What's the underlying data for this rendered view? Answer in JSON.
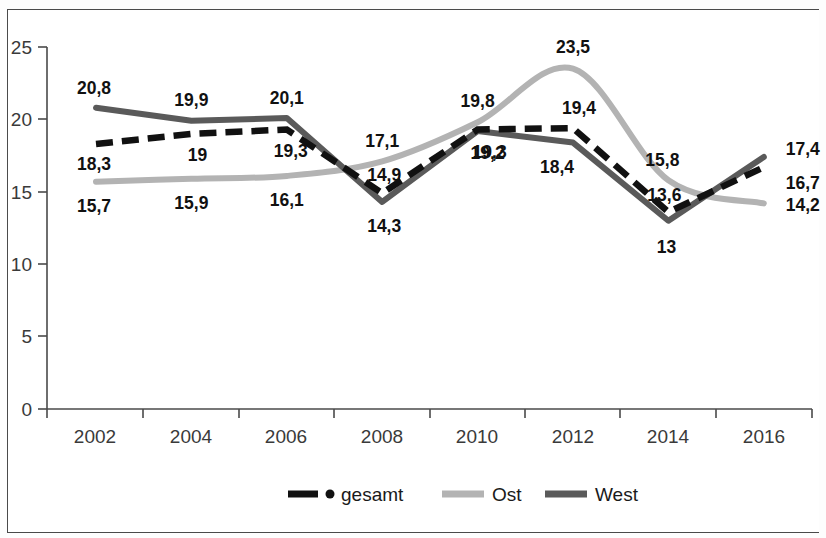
{
  "chart_data": {
    "type": "line",
    "title": "",
    "subtitle": "",
    "xlabel": "",
    "ylabel": "",
    "x": [
      2002,
      2004,
      2006,
      2008,
      2010,
      2012,
      2014,
      2016
    ],
    "categories": [
      "2002",
      "2004",
      "2006",
      "2008",
      "2010",
      "2012",
      "2014",
      "2016"
    ],
    "xtick_labels": [
      "2002",
      "2004",
      "2006",
      "2008",
      "2010",
      "2012",
      "2014",
      "2016"
    ],
    "ytick_labels": [
      "0",
      "5",
      "10",
      "15",
      "20",
      "25"
    ],
    "yticks": [
      0,
      5,
      10,
      15,
      20,
      25
    ],
    "ylim": [
      0,
      25
    ],
    "grid": false,
    "legend_position": "bottom",
    "series": [
      {
        "name": "gesamt",
        "color": "#111111",
        "style": "dashed",
        "values": [
          18.3,
          19,
          19.3,
          14.9,
          19.3,
          19.4,
          13.6,
          16.7
        ],
        "labels": [
          "18,3",
          "19",
          "19,3",
          "14,9",
          "19,3",
          "19,4",
          "13,6",
          "16,7"
        ]
      },
      {
        "name": "Ost",
        "color": "#b3b3b3",
        "style": "smooth",
        "values": [
          15.7,
          15.9,
          16.1,
          17.1,
          19.8,
          23.5,
          15.8,
          14.2
        ],
        "labels": [
          "15,7",
          "15,9",
          "16,1",
          "17,1",
          "19,8",
          "23,5",
          "15,8",
          "14,2"
        ]
      },
      {
        "name": "West",
        "color": "#5a5a5a",
        "style": "solid",
        "values": [
          20.8,
          19.9,
          20.1,
          14.3,
          19.2,
          18.4,
          13,
          17.4
        ],
        "labels": [
          "20,8",
          "19,9",
          "20,1",
          "14,3",
          "19,2",
          "18,4",
          "13",
          "17,4"
        ]
      }
    ]
  },
  "legend": {
    "items": [
      {
        "label": "gesamt",
        "color": "#111111",
        "marker": "dashed-line-with-dot"
      },
      {
        "label": "Ost",
        "color": "#b3b3b3",
        "marker": "solid-line"
      },
      {
        "label": "West",
        "color": "#5a5a5a",
        "marker": "solid-line"
      }
    ]
  },
  "axes": {
    "y_tick_labels": [
      "25",
      "20",
      "15",
      "10",
      "5",
      "0"
    ],
    "x_tick_labels": [
      "2002",
      "2004",
      "2006",
      "2008",
      "2010",
      "2012",
      "2014",
      "2016"
    ]
  },
  "value_labels": {
    "gesamt": [
      "18,3",
      "19",
      "19,3",
      "14,9",
      "19,3",
      "19,4",
      "13,6",
      "16,7"
    ],
    "ost": [
      "15,7",
      "15,9",
      "16,1",
      "17,1",
      "19,8",
      "23,5",
      "15,8",
      "14,2"
    ],
    "west": [
      "20,8",
      "19,9",
      "20,1",
      "14,3",
      "19,2",
      "18,4",
      "13",
      "17,4"
    ]
  },
  "colors": {
    "gesamt": "#111111",
    "ost": "#b3b3b3",
    "west": "#5a5a5a",
    "axis": "#4a4a4a",
    "text": "#3a3a3a",
    "background": "#ffffff"
  }
}
